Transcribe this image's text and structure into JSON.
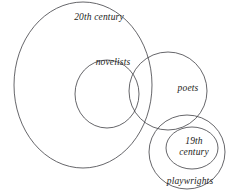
{
  "diagram": {
    "kind": "euler-diagram",
    "title_text": "",
    "stroke_color": "#3f3f44",
    "text_color": "#1d1d22",
    "background_color": "#ffffff",
    "canvas": {
      "width": 230,
      "height": 192
    },
    "sets": [
      {
        "id": "twentieth-century",
        "label": "20th century",
        "shape": "ellipse",
        "cx": 83,
        "cy": 85,
        "rx": 69,
        "ry": 83
      },
      {
        "id": "novelists",
        "label": "novelists",
        "shape": "ellipse",
        "cx": 107,
        "cy": 94,
        "rx": 32,
        "ry": 34
      },
      {
        "id": "poets",
        "label": "poets",
        "shape": "ellipse",
        "cx": 168,
        "cy": 91,
        "rx": 39,
        "ry": 39
      },
      {
        "id": "playwrights",
        "label": "playwrights",
        "shape": "ellipse",
        "cx": 187,
        "cy": 152,
        "rx": 38,
        "ry": 37
      },
      {
        "id": "nineteenth-century",
        "label_line_1": "19th",
        "label_line_2": "century",
        "label": "19th century",
        "shape": "ellipse",
        "cx": 192,
        "cy": 148,
        "rx": 26,
        "ry": 21
      }
    ]
  }
}
